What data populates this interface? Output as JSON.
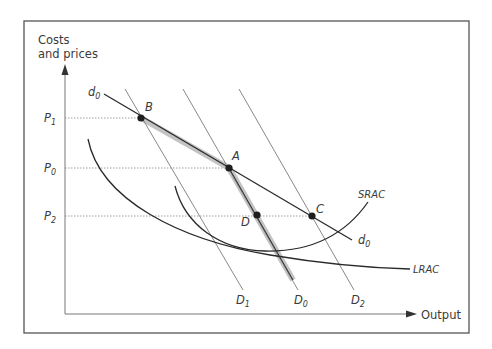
{
  "diagram": {
    "axes": {
      "y_label_line1": "Costs",
      "y_label_line2": "and prices",
      "x_label": "Output"
    },
    "price_levels": [
      {
        "label": "P",
        "sub": "1",
        "y": 118
      },
      {
        "label": "P",
        "sub": "0",
        "y": 168
      },
      {
        "label": "P",
        "sub": "2",
        "y": 216
      }
    ],
    "points": [
      {
        "label": "B",
        "x": 141,
        "y": 118
      },
      {
        "label": "A",
        "x": 229,
        "y": 168
      },
      {
        "label": "D",
        "x": 257,
        "y": 215
      },
      {
        "label": "C",
        "x": 312,
        "y": 216
      }
    ],
    "curves": {
      "d0_start_label": "d",
      "d0_start_sub": "0",
      "d0_end_label": "d",
      "d0_end_sub": "0",
      "srac_label": "SRAC",
      "lrac_label": "LRAC",
      "D1_label": "D",
      "D1_sub": "1",
      "D0_label": "D",
      "D0_sub": "0",
      "D2_label": "D",
      "D2_sub": "2"
    },
    "colors": {
      "frame": "#555555",
      "axis": "#777777",
      "curve": "#2a2a2a",
      "thin_line": "#7a7a7a",
      "highlight_band": "#bdbdbd",
      "dotted": "#888888",
      "point": "#1e1e1e"
    }
  }
}
